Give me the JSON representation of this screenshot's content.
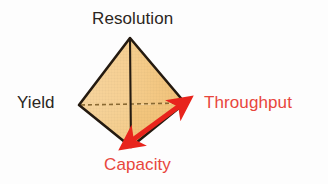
{
  "figure": {
    "title": "",
    "type": "tetrahedron-tradeoff-diagram",
    "background_color": "#fdfdfd",
    "solid": {
      "name": "tetrahedron",
      "fill_color_left": "#f7d296",
      "fill_color_right": "#f3c680",
      "edge_color": "#241a10",
      "hidden_edge_style": "dashed",
      "hidden_edge_color": "#8a6a33",
      "vertices": {
        "top": {
          "x": 130,
          "y": 38
        },
        "left": {
          "x": 79,
          "y": 105
        },
        "right": {
          "x": 185,
          "y": 103
        },
        "bottom": {
          "x": 131,
          "y": 147
        }
      }
    },
    "arrow": {
      "name": "tradeoff-arrow",
      "color": "#e8241c",
      "heads": "double",
      "from_label": "Capacity",
      "to_label": "Throughput",
      "from": {
        "x": 128,
        "y": 144
      },
      "to": {
        "x": 184,
        "y": 104
      }
    },
    "labels": [
      {
        "id": "resolution",
        "text": "Resolution",
        "color": "#2b2622",
        "position": "top"
      },
      {
        "id": "yield",
        "text": "Yield",
        "color": "#2b2622",
        "position": "left"
      },
      {
        "id": "throughput",
        "text": "Throughput",
        "color": "#e8463c",
        "position": "right"
      },
      {
        "id": "capacity",
        "text": "Capacity",
        "color": "#e8463c",
        "position": "bottom"
      }
    ]
  }
}
